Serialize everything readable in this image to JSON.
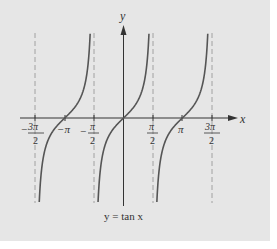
{
  "chart_data": {
    "type": "line",
    "title": "",
    "caption": "y = tan x",
    "xlabel": "x",
    "ylabel": "y",
    "function": "tan(x)",
    "series": [
      {
        "name": "y = tan x",
        "domain": [
          -4.712,
          4.712
        ],
        "color": "#555555"
      }
    ],
    "asymptotes": [
      -4.712,
      -1.571,
      1.571,
      4.712
    ],
    "asymptote_labels": [
      "-3π/2",
      "-π/2",
      "π/2",
      "3π/2"
    ],
    "xticks": [
      {
        "value": -4.712,
        "label": "-3π/2"
      },
      {
        "value": -3.1416,
        "label": "-π"
      },
      {
        "value": -1.571,
        "label": "-π/2"
      },
      {
        "value": 1.571,
        "label": "π/2"
      },
      {
        "value": 3.1416,
        "label": "π"
      },
      {
        "value": 4.712,
        "label": "3π/2"
      }
    ],
    "zeros": [
      -3.1416,
      0,
      3.1416
    ],
    "grid": false,
    "legend": "none"
  },
  "labels": {
    "x_axis": "x",
    "y_axis": "y",
    "caption": "y = tan x",
    "ticks": {
      "neg_3pi_2": {
        "sign": "−",
        "num": "3π",
        "den": "2"
      },
      "neg_pi": "−π",
      "neg_pi_2": {
        "sign": "−",
        "num": "π",
        "den": "2"
      },
      "pi_2": {
        "num": "π",
        "den": "2"
      },
      "pi": "π",
      "pi3_2": {
        "num": "3π",
        "den": "2"
      }
    }
  },
  "colors": {
    "background": "#e6e6e6",
    "curve": "#555555",
    "axis": "#333333",
    "asymptote": "#999999"
  }
}
